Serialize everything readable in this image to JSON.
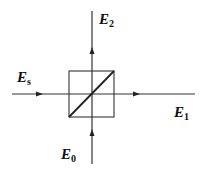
{
  "diagram": {
    "type": "beam-splitter",
    "colors": {
      "line": "#333333",
      "text": "#111111",
      "background": "#ffffff"
    },
    "labels": {
      "input_signal": {
        "base": "E",
        "sub": "s"
      },
      "output_transmitted": {
        "base": "E",
        "sub": "1"
      },
      "output_reflected": {
        "base": "E",
        "sub": "2"
      },
      "input_local": {
        "base": "E",
        "sub": "0"
      }
    },
    "beams": [
      {
        "name": "signal-beam",
        "label": "E_s",
        "direction": "right"
      },
      {
        "name": "transmitted-beam",
        "label": "E_1",
        "direction": "right"
      },
      {
        "name": "reflected-beam",
        "label": "E_2",
        "direction": "up"
      },
      {
        "name": "local-beam",
        "label": "E_0",
        "direction": "up"
      }
    ]
  }
}
